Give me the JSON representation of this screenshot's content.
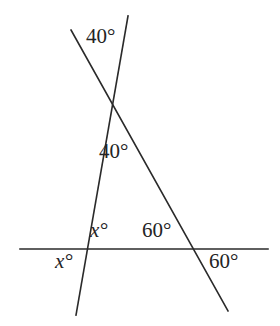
{
  "figure": {
    "type": "geometry-angle-diagram",
    "background_color": "#ffffff",
    "stroke_color": "#2a2a2a",
    "stroke_width": 1.6,
    "width": 280,
    "height": 326
  },
  "labels": {
    "top_40": "40°",
    "mid_40": "40°",
    "upper_x": "x°",
    "lower_x": "x°",
    "upper_60": "60°",
    "lower_60": "60°"
  },
  "lines": [
    {
      "name": "horizontal-base-line",
      "x1": 20,
      "y1": 249,
      "x2": 268,
      "y2": 249
    },
    {
      "name": "steep-left-line",
      "x1": 128,
      "y1": 16,
      "x2": 76,
      "y2": 315
    },
    {
      "name": "transversal-right-line",
      "x1": 71,
      "y1": 30,
      "x2": 228,
      "y2": 311
    }
  ],
  "vertices": [
    {
      "name": "apex-intersection",
      "x": 110,
      "y": 97
    },
    {
      "name": "left-base-intersection",
      "x": 88,
      "y": 249
    },
    {
      "name": "right-base-intersection",
      "x": 192,
      "y": 249
    }
  ],
  "chart_data": {
    "type": "table",
    "title": "",
    "categories": [
      "top 40°",
      "interior 40°",
      "interior x°",
      "exterior x°",
      "interior 60°",
      "exterior 60°"
    ],
    "values": [
      40,
      40,
      null,
      null,
      60,
      60
    ],
    "annotations": [
      {
        "label": "40°",
        "position": "above apex, left of steep line",
        "x": 96,
        "y": 38
      },
      {
        "label": "40°",
        "position": "interior apex angle of triangle",
        "x": 110,
        "y": 152
      },
      {
        "label": "x°",
        "position": "interior base angle at left vertex",
        "x": 100,
        "y": 231
      },
      {
        "label": "x°",
        "position": "exterior angle below left vertex",
        "x": 65,
        "y": 262
      },
      {
        "label": "60°",
        "position": "interior base angle at right vertex",
        "x": 158,
        "y": 231
      },
      {
        "label": "60°",
        "position": "exterior angle below right vertex",
        "x": 225,
        "y": 262
      }
    ]
  }
}
